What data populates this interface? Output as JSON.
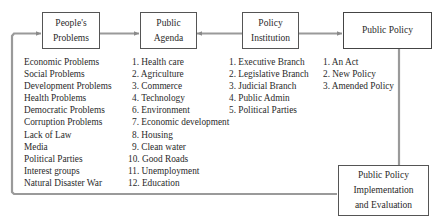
{
  "diagram": {
    "type": "flowchart",
    "line_color": "#9a9a9a",
    "box_border_color": "#555555",
    "nodes": [
      {
        "id": "peoples_problems",
        "label_lines": [
          "People's",
          "Problems"
        ],
        "items": [
          "Economic Problems",
          "Social Problems",
          "Development Problems",
          "Health Problems",
          "Democratic Problems",
          "Corruption Problems",
          "Lack of Law",
          "Media",
          "Political Parties",
          "Interest groups",
          "Natural Disaster War"
        ]
      },
      {
        "id": "public_agenda",
        "label_lines": [
          "Public",
          "Agenda"
        ],
        "items": [
          "1. Health care",
          "2. Agriculture",
          "3. Commerce",
          "4. Technology",
          "6. Environment",
          "7. Economic development",
          "8. Housing",
          "9. Clean water",
          "10. Good Roads",
          "11. Unemployment",
          "12. Education"
        ]
      },
      {
        "id": "policy_institution",
        "label_lines": [
          "Policy",
          "Institution"
        ],
        "items": [
          "1. Executive Branch",
          "2. Legislative Branch",
          "3. Judicial Branch",
          "4. Public Admin",
          "5. Political Parties"
        ]
      },
      {
        "id": "public_policy",
        "label_lines": [
          "Public Policy"
        ],
        "items": [
          "1. An Act",
          "2. New Policy",
          "3. Amended Policy"
        ]
      },
      {
        "id": "implementation",
        "label_lines": [
          "Public Policy",
          "Implementation",
          "and Evaluation"
        ],
        "items": []
      }
    ],
    "edges": [
      {
        "from": "peoples_problems",
        "to": "public_agenda"
      },
      {
        "from": "policy_institution",
        "to": "public_agenda"
      },
      {
        "from": "policy_institution",
        "to": "public_policy"
      },
      {
        "from": "public_policy",
        "to": "implementation"
      },
      {
        "from": "implementation",
        "to": "peoples_problems",
        "routing": "bottom-left loop"
      }
    ]
  }
}
